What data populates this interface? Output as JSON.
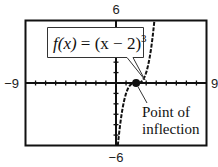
{
  "chart_data": {
    "type": "line",
    "title": "",
    "function_label": "f(x) = (x − 2)³",
    "function_parts": {
      "lhs": "f(x)",
      "eq": " = ",
      "rhs": "(x − 2)",
      "exponent": "3"
    },
    "expression": "(x-2)^3",
    "xlim": [
      -9,
      9
    ],
    "ylim": [
      -6,
      6
    ],
    "window_labels": {
      "xmin": "−9",
      "xmax": "9",
      "ymin": "−6",
      "ymax": "6"
    },
    "xtick_step": 1,
    "ytick_step": 1,
    "grid": false,
    "line_style": "dashed",
    "series": [
      {
        "name": "f(x) = (x − 2)³",
        "x": [
          0.183,
          0.5,
          1.0,
          1.5,
          2.0,
          2.5,
          3.0,
          3.5,
          3.817
        ],
        "values": [
          -6.0,
          -3.375,
          -1.0,
          -0.125,
          0.0,
          0.125,
          1.0,
          3.375,
          6.0
        ]
      }
    ],
    "annotations": [
      {
        "text_lines": [
          "Point of",
          "inflection"
        ],
        "point": [
          2,
          0
        ]
      }
    ]
  },
  "colors": {
    "ink": "#111111",
    "background": "#ffffff",
    "box_fill": "#ffffff"
  }
}
